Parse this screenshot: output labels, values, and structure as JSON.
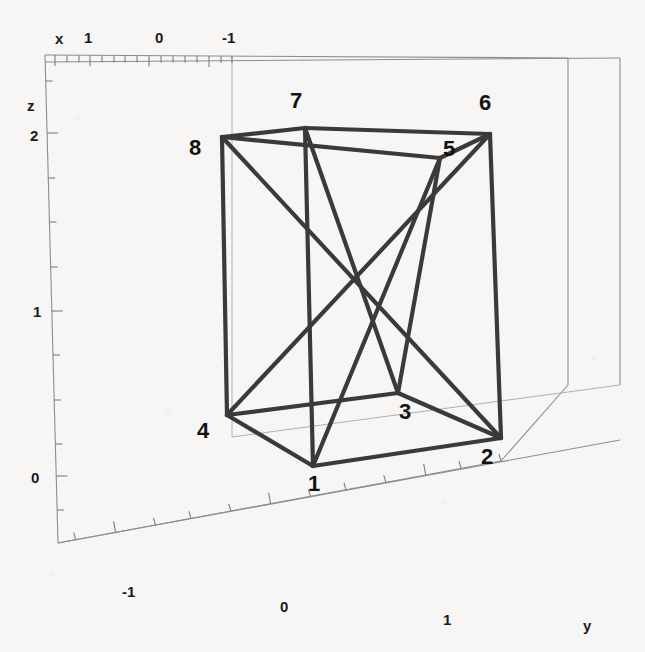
{
  "figure": {
    "kind": "3d-wireframe-plot",
    "background_color": "#f7f6f4",
    "frame_color": "#8d8d8d",
    "edge_color": "#3a3a3a",
    "width": 645,
    "height": 652
  },
  "axes": {
    "x": {
      "label": "x",
      "label_pos": {
        "x": 55,
        "y": 30
      },
      "direction": "right-to-left along top edge",
      "tick_labels": [
        {
          "text": "1",
          "x": 84,
          "y": 29
        },
        {
          "text": "0",
          "x": 155,
          "y": 29
        },
        {
          "text": "-1",
          "x": 222,
          "y": 29
        }
      ],
      "range": [
        1.6,
        -1.6
      ]
    },
    "y": {
      "label": "y",
      "label_pos": {
        "x": 583,
        "y": 617
      },
      "direction": "left-to-right along bottom edge",
      "tick_labels": [
        {
          "text": "-1",
          "x": 122,
          "y": 583
        },
        {
          "text": "0",
          "x": 280,
          "y": 598
        },
        {
          "text": "1",
          "x": 443,
          "y": 611
        }
      ],
      "range": [
        -1.6,
        1.6
      ]
    },
    "z": {
      "label": "z",
      "label_pos": {
        "x": 27,
        "y": 97
      },
      "direction": "bottom-to-top along left edge",
      "tick_labels": [
        {
          "text": "2",
          "x": 30,
          "y": 127
        },
        {
          "text": "1",
          "x": 33,
          "y": 303
        },
        {
          "text": "0",
          "x": 31,
          "y": 469
        }
      ],
      "range": [
        -0.35,
        2.75
      ]
    }
  },
  "frame": {
    "outline_points": "45,55 568,58 620,58 620,385 568,385 568,385 501,461 58,543 58,543 45,55",
    "back_left_vertical": {
      "x1": 45,
      "y1": 55,
      "x2": 58,
      "y2": 543
    },
    "back_right_vertical": {
      "x1": 568,
      "y1": 58,
      "x2": 568,
      "y2": 385
    },
    "far_right_vertical": {
      "x1": 620,
      "y1": 58,
      "x2": 620,
      "y2": 385
    },
    "top_front": {
      "x1": 45,
      "y1": 55,
      "x2": 568,
      "y2": 58
    },
    "top_back": {
      "x1": 45,
      "y1": 62,
      "x2": 620,
      "y2": 58
    },
    "bottom_left": {
      "x1": 58,
      "y1": 543,
      "x2": 501,
      "y2": 461
    },
    "bottom_right": {
      "x1": 501,
      "y1": 461,
      "x2": 568,
      "y2": 385
    },
    "mid_horizontal": {
      "x1": 58,
      "y1": 543,
      "x2": 620,
      "y2": 440
    },
    "inner_vertical": {
      "x1": 232,
      "y1": 55,
      "x2": 232,
      "y2": 437
    },
    "inner_horizontal": {
      "x1": 232,
      "y1": 437,
      "x2": 620,
      "y2": 385
    }
  },
  "x_axis_ticks_top": [
    {
      "x": 55,
      "major": true
    },
    {
      "x": 67,
      "major": false
    },
    {
      "x": 79,
      "major": false
    },
    {
      "x": 90,
      "major": true
    },
    {
      "x": 102,
      "major": false
    },
    {
      "x": 114,
      "major": false
    },
    {
      "x": 125,
      "major": false
    },
    {
      "x": 137,
      "major": false
    },
    {
      "x": 149,
      "major": true
    },
    {
      "x": 161,
      "major": false
    },
    {
      "x": 173,
      "major": false
    },
    {
      "x": 185,
      "major": false
    },
    {
      "x": 197,
      "major": false
    },
    {
      "x": 209,
      "major": true
    },
    {
      "x": 221,
      "major": false
    },
    {
      "x": 232,
      "major": false
    }
  ],
  "y_axis_ticks_bottom": [
    {
      "t": 0.04,
      "major": false
    },
    {
      "t": 0.13,
      "major": true
    },
    {
      "t": 0.22,
      "major": false
    },
    {
      "t": 0.3,
      "major": false
    },
    {
      "t": 0.39,
      "major": false
    },
    {
      "t": 0.48,
      "major": true
    },
    {
      "t": 0.57,
      "major": false
    },
    {
      "t": 0.65,
      "major": false
    },
    {
      "t": 0.74,
      "major": false
    },
    {
      "t": 0.83,
      "major": true
    },
    {
      "t": 0.91,
      "major": false
    },
    {
      "t": 1.0,
      "major": false
    }
  ],
  "z_axis_ticks_left": [
    {
      "y": 81,
      "major": false
    },
    {
      "y": 133,
      "major": true
    },
    {
      "y": 178,
      "major": false
    },
    {
      "y": 222,
      "major": false
    },
    {
      "y": 267,
      "major": false
    },
    {
      "y": 311,
      "major": true
    },
    {
      "y": 355,
      "major": false
    },
    {
      "y": 400,
      "major": false
    },
    {
      "y": 444,
      "major": false
    },
    {
      "y": 476,
      "major": true
    },
    {
      "y": 510,
      "major": false
    }
  ],
  "shape": {
    "name": "labelled-cube-wireframe-with-diagonals",
    "vertices": [
      {
        "id": "1",
        "x": 313,
        "y": 466,
        "label_x": 308,
        "label_y": 471
      },
      {
        "id": "2",
        "x": 501,
        "y": 438,
        "label_x": 481,
        "label_y": 444
      },
      {
        "id": "3",
        "x": 398,
        "y": 393,
        "label_x": 399,
        "label_y": 399
      },
      {
        "id": "4",
        "x": 227,
        "y": 415,
        "label_x": 197,
        "label_y": 418
      },
      {
        "id": "5",
        "x": 440,
        "y": 158,
        "label_x": 443,
        "label_y": 136
      },
      {
        "id": "6",
        "x": 490,
        "y": 134,
        "label_x": 479,
        "label_y": 90
      },
      {
        "id": "7",
        "x": 305,
        "y": 128,
        "label_x": 290,
        "label_y": 88
      },
      {
        "id": "8",
        "x": 222,
        "y": 137,
        "label_x": 189,
        "label_y": 135
      }
    ],
    "edges": [
      [
        "1",
        "2"
      ],
      [
        "2",
        "3"
      ],
      [
        "3",
        "4"
      ],
      [
        "4",
        "1"
      ],
      [
        "5",
        "6"
      ],
      [
        "6",
        "7"
      ],
      [
        "7",
        "8"
      ],
      [
        "8",
        "5"
      ],
      [
        "1",
        "5"
      ],
      [
        "2",
        "6"
      ],
      [
        "3",
        "7"
      ],
      [
        "4",
        "8"
      ],
      [
        "1",
        "7"
      ],
      [
        "3",
        "5"
      ],
      [
        "2",
        "8"
      ],
      [
        "4",
        "6"
      ]
    ]
  },
  "vertex_labels": [
    "1",
    "2",
    "3",
    "4",
    "5",
    "6",
    "7",
    "8"
  ]
}
